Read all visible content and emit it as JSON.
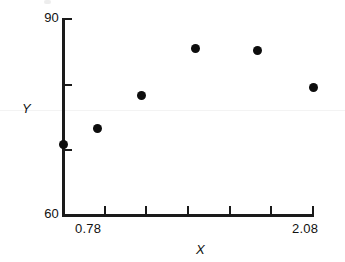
{
  "chart_data": {
    "type": "scatter",
    "title": "",
    "xlabel": "X",
    "ylabel": "Y",
    "xlim": [
      0.78,
      2.08
    ],
    "ylim": [
      60,
      90
    ],
    "grid": false,
    "legend": null,
    "x_tick_labels": [
      "0.78",
      "2.08"
    ],
    "y_tick_labels": [
      "90",
      "60"
    ],
    "x_tick_count": 7,
    "y_tick_count": 4,
    "marker": "filled-circle",
    "marker_color": "#0d0d0d",
    "x": [
      0.78,
      0.96,
      1.19,
      1.47,
      1.79,
      2.08
    ],
    "y": [
      70.8,
      73.2,
      78.2,
      85.3,
      85.0,
      79.4
    ],
    "points": [
      {
        "x": 0.78,
        "y": 70.8
      },
      {
        "x": 0.96,
        "y": 73.2
      },
      {
        "x": 1.19,
        "y": 78.2
      },
      {
        "x": 1.47,
        "y": 85.3
      },
      {
        "x": 1.79,
        "y": 85.0
      },
      {
        "x": 2.08,
        "y": 79.4
      }
    ]
  },
  "axes": {
    "y": {
      "top_label": "90",
      "bottom_label": "60",
      "title": "Y"
    },
    "x": {
      "left_label": "0.78",
      "right_label": "2.08",
      "title": "X"
    }
  },
  "colors": {
    "ink": "#1a1a1a",
    "marker": "#0d0d0d",
    "background": "#ffffff"
  }
}
